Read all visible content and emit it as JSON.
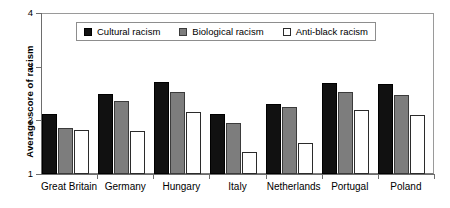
{
  "chart_data": {
    "type": "bar",
    "title": "",
    "xlabel": "",
    "ylabel": "Average score of racism",
    "ylim": [
      1,
      4
    ],
    "yticks": [
      1,
      2,
      3,
      4
    ],
    "ytick_labels": [
      "1",
      "2",
      "3",
      "4"
    ],
    "grid": false,
    "legend_position": "top-center",
    "categories": [
      "Great Britain",
      "Germany",
      "Hungary",
      "Italy",
      "Netherlands",
      "Portugal",
      "Poland"
    ],
    "series": [
      {
        "name": "Cultural racism",
        "color": "#111111",
        "values": [
          2.12,
          2.49,
          2.72,
          2.12,
          2.31,
          2.7,
          2.68
        ]
      },
      {
        "name": "Biological racism",
        "color": "#7d7d7d",
        "values": [
          1.86,
          2.36,
          2.53,
          1.95,
          2.24,
          2.53,
          2.47
        ]
      },
      {
        "name": "Anti-black racism",
        "color": "#ffffff",
        "values": [
          1.82,
          1.8,
          2.16,
          1.41,
          1.58,
          2.19,
          2.1
        ]
      }
    ]
  },
  "legend": {
    "items": [
      {
        "label": "Cultural racism"
      },
      {
        "label": "Biological racism"
      },
      {
        "label": "Anti-black racism"
      }
    ]
  }
}
